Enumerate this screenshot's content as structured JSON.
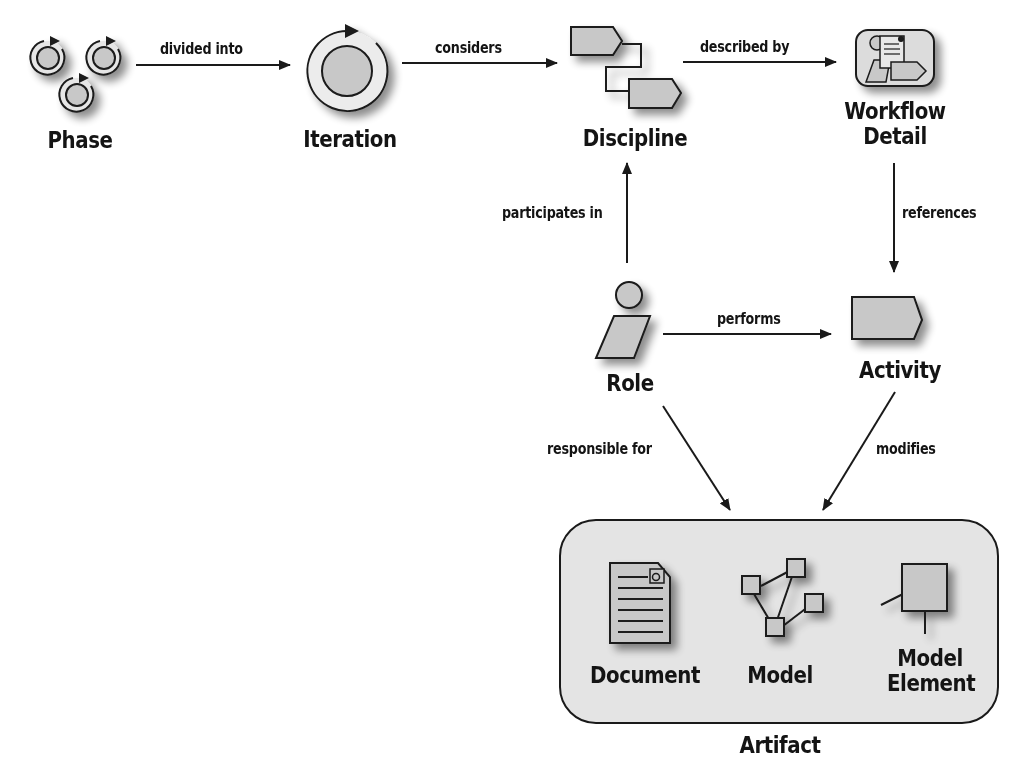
{
  "diagram": {
    "type": "process-metamodel",
    "colors": {
      "background": "#ffffff",
      "shape_fill": "#c8c8c8",
      "stroke": "#1a1a1a",
      "artifact_container_fill": "#e4e4e4",
      "text": "#141414"
    },
    "nodes": {
      "phase": {
        "label": "Phase",
        "icon": "phase-cycles-icon"
      },
      "iteration": {
        "label": "Iteration",
        "icon": "iteration-cycle-icon"
      },
      "discipline": {
        "label": "Discipline",
        "icon": "discipline-workflow-icon"
      },
      "workflow_detail": {
        "label_line1": "Workflow",
        "label_line2": "Detail",
        "icon": "workflow-detail-icon"
      },
      "role": {
        "label": "Role",
        "icon": "role-person-icon"
      },
      "activity": {
        "label": "Activity",
        "icon": "activity-pentagon-icon"
      },
      "artifact": {
        "label": "Artifact",
        "children": {
          "document": {
            "label": "Document",
            "icon": "document-icon"
          },
          "model": {
            "label": "Model",
            "icon": "model-graph-icon"
          },
          "model_element": {
            "label_line1": "Model",
            "label_line2": "Element",
            "icon": "model-element-icon"
          }
        }
      }
    },
    "edges": {
      "phase_iteration": {
        "from": "Phase",
        "to": "Iteration",
        "label": "divided into"
      },
      "iteration_discipline": {
        "from": "Iteration",
        "to": "Discipline",
        "label": "considers"
      },
      "discipline_workflow": {
        "from": "Discipline",
        "to": "Workflow Detail",
        "label": "described by"
      },
      "workflow_activity": {
        "from": "Workflow Detail",
        "to": "Activity",
        "label": "references"
      },
      "role_discipline": {
        "from": "Role",
        "to": "Discipline",
        "label": "participates in"
      },
      "role_activity": {
        "from": "Role",
        "to": "Activity",
        "label": "performs"
      },
      "role_artifact": {
        "from": "Role",
        "to": "Artifact",
        "label": "responsible for"
      },
      "activity_artifact": {
        "from": "Activity",
        "to": "Artifact",
        "label": "modifies"
      }
    }
  }
}
